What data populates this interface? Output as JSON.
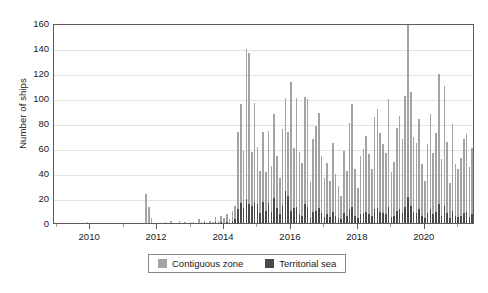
{
  "chart_data": {
    "type": "bar",
    "title": "",
    "subtitle": "",
    "xlabel": "",
    "ylabel": "Number of ships",
    "stacked": true,
    "grid": true,
    "legend_position": "bottom-center",
    "ylim": [
      0,
      160
    ],
    "ytick_step": 20,
    "yticks": [
      "0",
      "20",
      "40",
      "60",
      "80",
      "100",
      "120",
      "140",
      "160"
    ],
    "xlim": [
      2008.92,
      2021.5
    ],
    "xticks": [
      "2010",
      "2012",
      "2014",
      "2016",
      "2018",
      "2020"
    ],
    "xtick_values": [
      2010,
      2012,
      2014,
      2016,
      2018,
      2020
    ],
    "x_interval": "monthly",
    "x_start": "2009-01",
    "x_end": "2021-06",
    "colors": {
      "contiguous_zone": "#a3a3a3",
      "territorial_sea": "#4a4a4a",
      "axis": "#5d5d5d",
      "grid": "#e2e2e2",
      "text": "#1a1a1a",
      "background": "#ffffff",
      "legend_border": "#8a8a8a"
    },
    "series": [
      {
        "name": "Contiguous zone",
        "color": "#a3a3a3",
        "values": [
          0,
          0,
          0,
          0,
          0,
          0,
          0,
          0,
          0,
          0,
          0,
          1,
          0,
          0,
          0,
          0,
          0,
          0,
          0,
          0,
          0,
          0,
          0,
          0,
          0,
          0,
          0,
          0,
          0,
          0,
          0,
          0,
          23,
          13,
          4,
          0,
          0,
          0,
          0,
          1,
          0,
          2,
          0,
          0,
          2,
          0,
          1,
          0,
          1,
          1,
          0,
          3,
          1,
          1,
          0,
          2,
          1,
          4,
          2,
          5,
          4,
          6,
          3,
          8,
          11,
          62,
          79,
          46,
          120,
          121,
          43,
          79,
          46,
          34,
          56,
          31,
          58,
          37,
          67,
          42,
          29,
          61,
          74,
          51,
          103,
          48,
          87,
          50,
          42,
          86,
          86,
          29,
          58,
          68,
          76,
          46,
          31,
          41,
          29,
          55,
          33,
          26,
          19,
          50,
          36,
          69,
          82,
          37,
          24,
          47,
          51,
          61,
          48,
          37,
          74,
          79,
          63,
          55,
          49,
          86,
          36,
          43,
          66,
          75,
          59,
          89,
          145,
          91,
          60,
          56,
          72,
          41,
          30,
          55,
          76,
          49,
          63,
          104,
          45,
          96,
          57,
          28,
          69,
          41,
          38,
          46,
          59,
          62,
          40,
          53,
          82,
          48,
          35,
          68,
          40,
          33,
          26,
          64,
          78,
          66,
          68,
          84,
          72,
          100,
          92,
          63,
          99,
          71,
          129,
          97,
          60,
          84,
          72,
          114,
          109,
          87,
          66,
          64,
          52,
          58,
          46,
          73,
          87,
          61,
          66,
          79,
          123,
          98,
          74,
          81,
          55,
          86,
          41,
          58,
          93,
          61,
          88,
          103,
          117,
          84,
          62,
          70,
          96,
          75
        ]
      },
      {
        "name": "Territorial sea",
        "color": "#4a4a4a",
        "values": [
          0,
          0,
          0,
          0,
          0,
          0,
          0,
          0,
          0,
          0,
          0,
          0,
          0,
          0,
          0,
          0,
          0,
          0,
          0,
          0,
          0,
          0,
          0,
          0,
          0,
          0,
          0,
          0,
          0,
          0,
          0,
          0,
          0,
          0,
          0,
          0,
          0,
          0,
          0,
          0,
          0,
          0,
          0,
          0,
          0,
          0,
          0,
          0,
          0,
          0,
          0,
          0,
          0,
          1,
          0,
          0,
          0,
          1,
          0,
          1,
          0,
          1,
          0,
          2,
          3,
          11,
          16,
          12,
          19,
          15,
          14,
          17,
          15,
          8,
          17,
          10,
          16,
          9,
          20,
          12,
          7,
          14,
          26,
          22,
          10,
          12,
          13,
          7,
          6,
          15,
          13,
          4,
          9,
          10,
          12,
          8,
          5,
          7,
          5,
          9,
          6,
          4,
          3,
          8,
          6,
          11,
          13,
          6,
          4,
          7,
          8,
          9,
          7,
          6,
          11,
          12,
          9,
          8,
          7,
          13,
          5,
          6,
          10,
          11,
          8,
          13,
          21,
          14,
          9,
          8,
          11,
          6,
          4,
          8,
          11,
          7,
          9,
          15,
          6,
          14,
          8,
          4,
          10,
          6,
          5,
          6,
          8,
          9,
          5,
          7,
          11,
          6,
          4,
          9,
          5,
          4,
          3,
          8,
          10,
          8,
          9,
          11,
          9,
          13,
          12,
          8,
          13,
          9,
          16,
          12,
          7,
          11,
          9,
          15,
          14,
          11,
          8,
          8,
          6,
          7,
          5,
          9,
          11,
          8,
          8,
          10,
          16,
          13,
          9,
          10,
          7,
          11,
          5,
          7,
          12,
          8,
          11,
          13,
          15,
          11,
          8,
          9,
          12,
          10
        ]
      }
    ]
  },
  "legend": {
    "items": [
      {
        "label": "Contiguous zone",
        "color": "#a3a3a3"
      },
      {
        "label": "Territorial sea",
        "color": "#4a4a4a"
      }
    ]
  },
  "axis": {
    "y_title": "Number of ships"
  }
}
